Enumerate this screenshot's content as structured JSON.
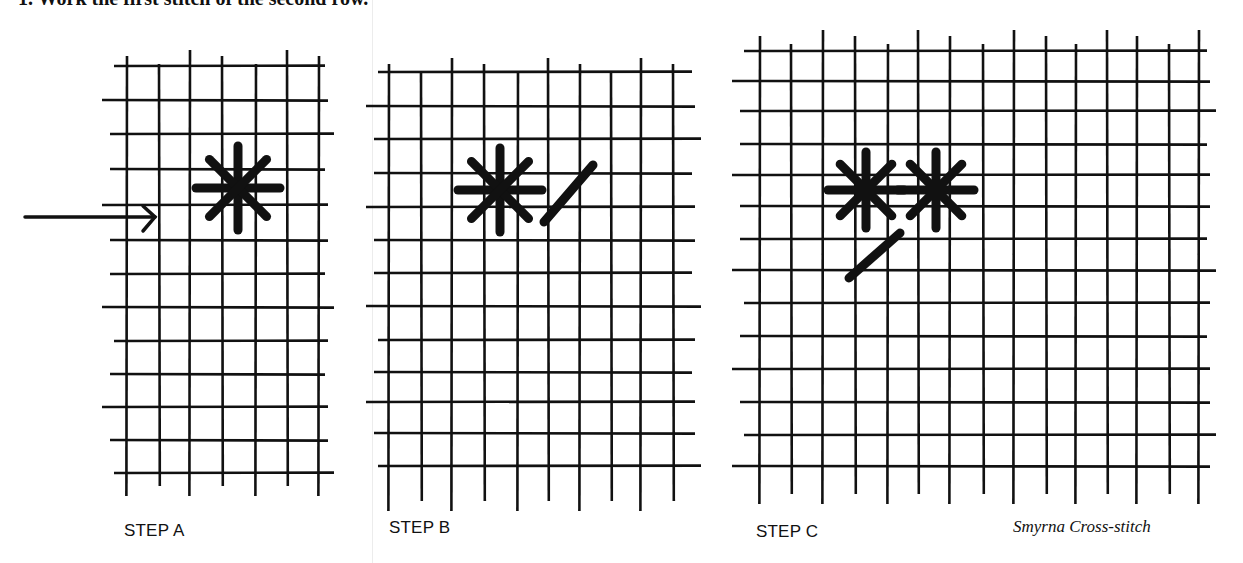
{
  "header": {
    "instruction_text": "1. Work the first stitch of the second row."
  },
  "figures": [
    {
      "id": "A",
      "caption": "STEP A",
      "grid": {
        "vlines": [
          127,
          159,
          190,
          222,
          256,
          287,
          319
        ],
        "hlines": [
          66,
          100,
          134,
          169,
          205,
          240,
          274,
          307,
          341,
          374,
          407,
          440,
          473
        ],
        "x_extent": [
          110,
          328
        ],
        "y_extent": [
          48,
          490
        ]
      },
      "stars": [
        {
          "cx": 238,
          "cy": 188,
          "r": 42
        }
      ],
      "slashes": [],
      "arrow": {
        "x1": 25,
        "y1": 217,
        "x2": 155,
        "y2": 217
      }
    },
    {
      "id": "B",
      "caption": "STEP B",
      "grid": {
        "vlines": [
          389,
          421,
          452,
          484,
          518,
          548,
          580,
          611,
          641,
          673
        ],
        "hlines": [
          72,
          106,
          139,
          173,
          207,
          240,
          273,
          306,
          340,
          372,
          402,
          433,
          466
        ],
        "x_extent": [
          374,
          695
        ],
        "y_extent": [
          56,
          505
        ]
      },
      "stars": [
        {
          "cx": 500,
          "cy": 190,
          "r": 42
        }
      ],
      "slashes": [
        {
          "x1": 544,
          "y1": 222,
          "x2": 593,
          "y2": 165
        }
      ],
      "arrow": null
    },
    {
      "id": "C",
      "caption": "STEP C",
      "grid": {
        "vlines": [
          760,
          791,
          823,
          855,
          888,
          918,
          950,
          983,
          1014,
          1046,
          1076,
          1107,
          1137,
          1169,
          1199
        ],
        "hlines": [
          51,
          81,
          111,
          144,
          175,
          206,
          239,
          270,
          303,
          336,
          369,
          402,
          435,
          466
        ],
        "x_extent": [
          740,
          1210
        ],
        "y_extent": [
          28,
          498
        ]
      },
      "stars": [
        {
          "cx": 866,
          "cy": 190,
          "r": 38
        },
        {
          "cx": 936,
          "cy": 190,
          "r": 38
        }
      ],
      "slashes": [
        {
          "x1": 849,
          "y1": 278,
          "x2": 900,
          "y2": 233
        }
      ],
      "arrow": null
    }
  ],
  "credit": "Smyrna Cross-stitch",
  "colors": {
    "ink": "#111111",
    "background": "#ffffff"
  }
}
